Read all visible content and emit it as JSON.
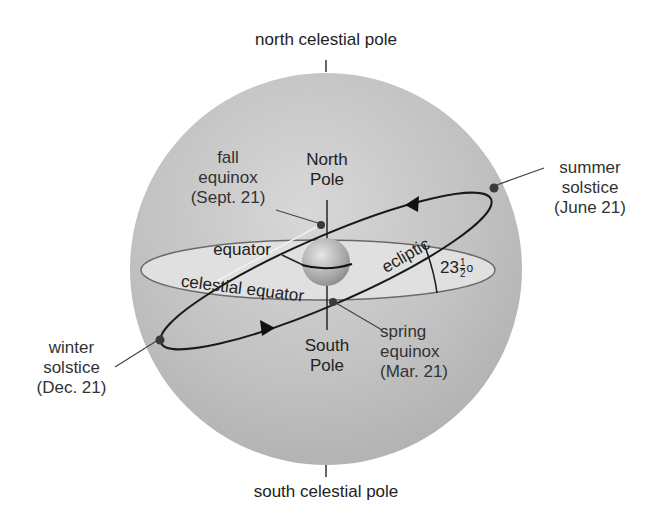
{
  "diagram": {
    "poles": {
      "north_celestial": "north celestial pole",
      "south_celestial": "south celestial pole"
    },
    "earth": {
      "north_pole": [
        "North",
        "Pole"
      ],
      "south_pole": [
        "South",
        "Pole"
      ],
      "equator": "equator"
    },
    "planes": {
      "celestial_equator": "celestial equator",
      "ecliptic": "ecliptic",
      "tilt_angle": "23",
      "tilt_fraction_num": "1",
      "tilt_fraction_den": "2",
      "tilt_degree": "o"
    },
    "events": {
      "fall_equinox": [
        "fall",
        "equinox",
        "(Sept. 21)"
      ],
      "summer_solstice": [
        "summer",
        "solstice",
        "(June 21)"
      ],
      "winter_solstice": [
        "winter",
        "solstice",
        "(Dec. 21)"
      ],
      "spring_equinox": [
        "spring",
        "equinox",
        "(Mar. 21)"
      ]
    },
    "colors": {
      "sphere": "#c4c4c4",
      "equator_plane": "#dcdcdc",
      "lines": "#1a1a1a",
      "text": "#333333"
    }
  }
}
